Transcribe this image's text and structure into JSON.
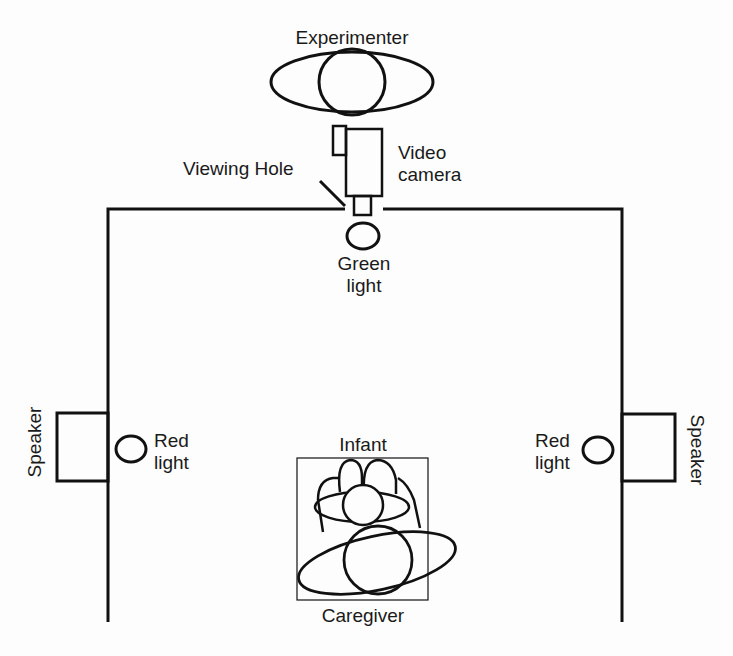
{
  "diagram": {
    "type": "experimental room layout (top-down)",
    "colors": {
      "stroke": "#111111",
      "background": "#fdfdfd",
      "text": "#1a1a1a"
    },
    "labels": {
      "experimenter": "Experimenter",
      "video_camera": [
        "Video",
        "camera"
      ],
      "viewing_hole": "Viewing Hole",
      "green_light": [
        "Green",
        "light"
      ],
      "left_speaker": "Speaker",
      "right_speaker": "Speaker",
      "left_red_light": [
        "Red",
        "light"
      ],
      "right_red_light": [
        "Red",
        "light"
      ],
      "infant": "Infant",
      "caregiver": "Caregiver"
    }
  }
}
